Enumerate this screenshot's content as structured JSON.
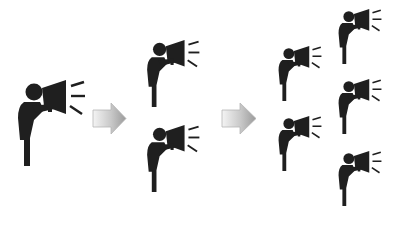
{
  "diagram": {
    "colors": {
      "figure": "#1f1f1f",
      "arrow_light": "#f2f2f2",
      "arrow_dark": "#9a9a9a",
      "arrow_stroke": "#b5b5b5",
      "background": "#ffffff"
    },
    "stages": [
      {
        "label": "stage-1",
        "speaker_count": 1
      },
      {
        "label": "stage-2",
        "speaker_count": 2
      },
      {
        "label": "stage-3",
        "speaker_count": 5
      }
    ],
    "arrows": [
      {
        "icon": "right-arrow-icon"
      },
      {
        "icon": "right-arrow-icon"
      }
    ],
    "speakers": [
      {
        "stage": 1,
        "x": 14,
        "y": 80,
        "scale": 1.0
      },
      {
        "stage": 2,
        "x": 144,
        "y": 40,
        "scale": 0.78
      },
      {
        "stage": 2,
        "x": 144,
        "y": 125,
        "scale": 0.78
      },
      {
        "stage": 3,
        "x": 274,
        "y": 45,
        "scale": 0.65
      },
      {
        "stage": 3,
        "x": 274,
        "y": 115,
        "scale": 0.65
      },
      {
        "stage": 3,
        "x": 334,
        "y": 8,
        "scale": 0.65
      },
      {
        "stage": 3,
        "x": 334,
        "y": 78,
        "scale": 0.65
      },
      {
        "stage": 3,
        "x": 334,
        "y": 150,
        "scale": 0.65
      }
    ],
    "caption": ""
  }
}
